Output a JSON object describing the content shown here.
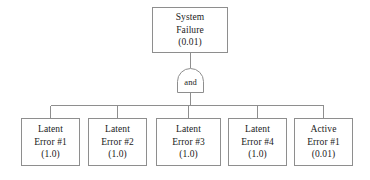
{
  "diagram": {
    "colors": {
      "background": "#ffffff",
      "stroke": "#8e8e8e",
      "text": "#1b1b1b"
    },
    "top_event": {
      "line1": "System",
      "line2": "Failure",
      "line3": "(0.01)"
    },
    "gate": {
      "label": "and",
      "type": "AND"
    },
    "basic_events": [
      {
        "line1": "Latent",
        "line2": "Error #1",
        "line3": "(1.0)"
      },
      {
        "line1": "Latent",
        "line2": "Error #2",
        "line3": "(1.0)"
      },
      {
        "line1": "Latent",
        "line2": "Error #3",
        "line3": "(1.0)"
      },
      {
        "line1": "Latent",
        "line2": "Error #4",
        "line3": "(1.0)"
      },
      {
        "line1": "Active",
        "line2": "Error #1",
        "line3": "(0.01)"
      }
    ]
  }
}
